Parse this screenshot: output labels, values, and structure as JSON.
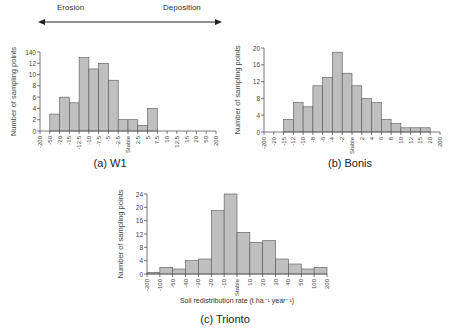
{
  "header": {
    "erosion_label": "Erosion",
    "deposition_label": "Deposition"
  },
  "captions": {
    "w1": "(a) W1",
    "bonis": "(b) Bonis",
    "trionto": "(c) Trionto"
  },
  "ylabel": "Number of sampling points",
  "xlabel": "Soil redistribution rate (t ha⁻¹ year⁻¹)",
  "colors": {
    "bar_fill": "#bfbfbf",
    "bar_stroke": "#555555",
    "axis": "#555555"
  },
  "chart_data": [
    {
      "type": "bar",
      "title": "(a) W1",
      "xlabel": "",
      "ylabel": "Number of sampling points",
      "ylim": [
        0,
        14
      ],
      "yticks": [
        "0",
        "2",
        "4",
        "6",
        "8",
        "10",
        "12",
        "140"
      ],
      "tick_labels": [
        "-200",
        "-50",
        "-20",
        "-15",
        "-12.5",
        "-10",
        "-7.5",
        "-5",
        "-2.5",
        "Stable",
        "2.5",
        "5",
        "7.5",
        "10",
        "12.5",
        "15",
        "20",
        "50",
        "200"
      ],
      "values": [
        0,
        3,
        6,
        5,
        13,
        11,
        12,
        9,
        2,
        2,
        1,
        4,
        0,
        0,
        0,
        0,
        0,
        0
      ]
    },
    {
      "type": "bar",
      "title": "(b) Bonis",
      "xlabel": "",
      "ylabel": "Number of sampling points",
      "ylim": [
        0,
        20
      ],
      "yticks": [
        "0",
        "4",
        "8",
        "12",
        "16",
        "20"
      ],
      "tick_labels": [
        "-200",
        "-20",
        "-15",
        "-12",
        "-10",
        "-8",
        "-6",
        "-4",
        "-2",
        "Stable",
        "2",
        "4",
        "6",
        "8",
        "10",
        "12",
        "15",
        "20",
        "200"
      ],
      "values": [
        0,
        0,
        3,
        7,
        6,
        11,
        13,
        19,
        14,
        11,
        8,
        7,
        3,
        2,
        1,
        1,
        1,
        0
      ]
    },
    {
      "type": "bar",
      "title": "(c) Trionto",
      "xlabel": "Soil redistribution rate (t ha-1 year-1)",
      "ylabel": "Number of sampling points",
      "ylim": [
        0,
        24
      ],
      "yticks": [
        "0",
        "4",
        "8",
        "12",
        "16",
        "20",
        "24"
      ],
      "tick_labels": [
        "-200",
        "-100",
        "-50",
        "-40",
        "-30",
        "-20",
        "-10",
        "Stable",
        "10",
        "20",
        "30",
        "40",
        "50",
        "100",
        "200"
      ],
      "values": [
        0.5,
        2,
        1.5,
        4,
        4.5,
        19,
        24,
        12.5,
        9.5,
        10,
        4.5,
        3,
        1.5,
        2,
        0
      ]
    }
  ]
}
